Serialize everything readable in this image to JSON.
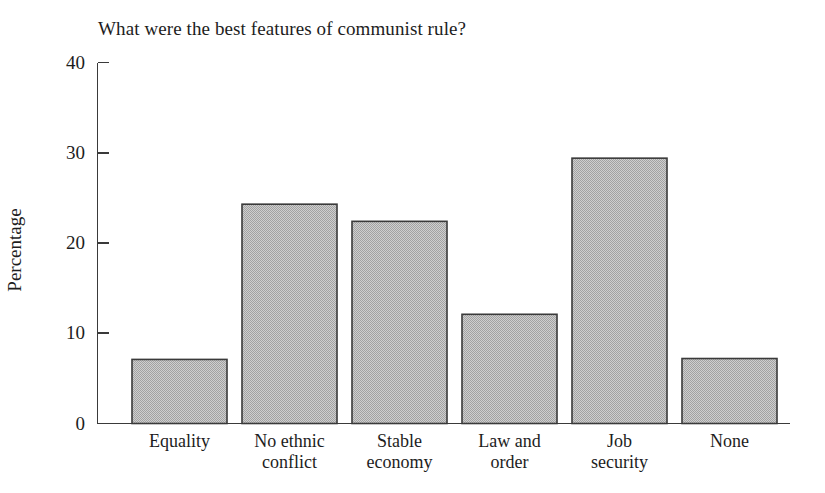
{
  "chart_data": {
    "type": "bar",
    "title": "What were the best features of communist rule?",
    "xlabel": "",
    "ylabel": "Percentage",
    "categories": [
      "Equality",
      "No ethnic conflict",
      "Stable economy",
      "Law and order",
      "Job security",
      "None"
    ],
    "category_lines": [
      [
        "Equality"
      ],
      [
        "No ethnic",
        "conflict"
      ],
      [
        "Stable",
        "economy"
      ],
      [
        "Law and",
        "order"
      ],
      [
        "Job",
        "security"
      ],
      [
        "None"
      ]
    ],
    "values": [
      7.1,
      24.3,
      22.4,
      12.1,
      29.4,
      7.2
    ],
    "ylim": [
      0,
      40
    ],
    "yticks": [
      0,
      10,
      20,
      30,
      40
    ],
    "ytick_labels": [
      "0",
      "10",
      "20",
      "30",
      "40"
    ],
    "grid": false,
    "legend": false,
    "bar_fill_color": "#b9b9b9",
    "bar_edge_color": "#3a3a3a",
    "axis_color": "#3a3a3a",
    "background_color": "#ffffff",
    "text_color": "#1d1d1d"
  }
}
